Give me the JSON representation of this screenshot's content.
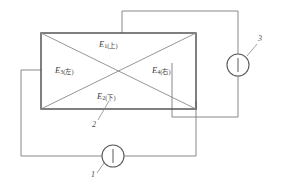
{
  "figure": {
    "type": "circuit-diagram",
    "colors": {
      "line": "#6e6e6e",
      "box": "#555555",
      "text": "#404040",
      "background": "#ffffff"
    }
  },
  "zones": [
    {
      "id": "top",
      "symbol": "E",
      "subscript": "1",
      "chinese": "(上)",
      "full": "E1(上)"
    },
    {
      "id": "bottom",
      "symbol": "E",
      "subscript": "2",
      "chinese": "(下)",
      "full": "E2(下)"
    },
    {
      "id": "left",
      "symbol": "E",
      "subscript": "3",
      "chinese": "(左)",
      "full": "E3(左)"
    },
    {
      "id": "right",
      "symbol": "E",
      "subscript": "4",
      "chinese": "(右)",
      "full": "E4(右)"
    }
  ],
  "callouts": [
    {
      "id": "callout-1",
      "label": "1",
      "points_to": "bottom-meter"
    },
    {
      "id": "callout-2",
      "label": "2",
      "points_to": "box-bottom-edge"
    },
    {
      "id": "callout-3",
      "label": "3",
      "points_to": "right-meter"
    }
  ],
  "meters": [
    {
      "id": "bottom-meter",
      "symbol": "|",
      "callout": "1"
    },
    {
      "id": "right-meter",
      "symbol": "|",
      "callout": "3"
    }
  ]
}
